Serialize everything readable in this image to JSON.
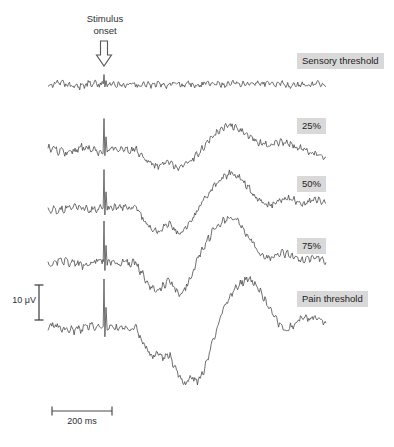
{
  "figure": {
    "type": "evoked-potential-traces",
    "background_color": "#ffffff",
    "trace_color": "#4a4a4a",
    "label_background_color": "#d9d9d9",
    "label_text_color": "#1d1d1d"
  },
  "annotations": {
    "stimulus_onset_label": "Stimulus\nonset",
    "stimulus_onset_icon": "arrow-down-icon",
    "amplitude_scale_label": "10 μV",
    "time_scale_label": "200 ms"
  },
  "chart_data": {
    "type": "line",
    "title": "",
    "xlabel": "",
    "ylabel": "",
    "legend_position": "right-inline",
    "grid": false,
    "scale_bars": {
      "amplitude": {
        "label": "10 μV",
        "value": 10,
        "unit": "μV"
      },
      "time": {
        "label": "200 ms",
        "value": 200,
        "unit": "ms"
      }
    },
    "stimulus_onset_ms": 0,
    "x_range_ms": [
      -250,
      1200
    ],
    "series": [
      {
        "name": "Sensory threshold",
        "label": "Sensory threshold",
        "baseline_y": 85,
        "n2_amplitude_uv": 0.5,
        "p2_amplitude_uv": 0.8,
        "noise_amplitude_uv": 1.0,
        "artifact_amplitude_uv": 3.0,
        "values": [
          0,
          0.3,
          -0.2,
          0.4,
          -0.3,
          0.2,
          0.5,
          -0.4,
          0.1,
          0.3,
          -0.2,
          0.4,
          0,
          -0.3,
          0.2,
          0.5,
          0.3,
          -0.1,
          0.4,
          0.2,
          -0.3,
          0.1,
          0.5,
          0.3,
          0,
          0.4,
          -0.2,
          0.3,
          0.6,
          0.4,
          0.2,
          0.5,
          0.3,
          0.7,
          0.5,
          0.3,
          0.6,
          0.4,
          0.2,
          0.5,
          0.1,
          -0.2,
          0.3,
          0,
          0.2,
          -0.3,
          0.1,
          0.4,
          0.2,
          -0.1
        ]
      },
      {
        "name": "25%",
        "label": "25%",
        "baseline_y": 150,
        "n2_amplitude_uv": -5.0,
        "p2_amplitude_uv": 7.0,
        "noise_amplitude_uv": 1.2,
        "artifact_amplitude_uv": 9.0,
        "values": [
          0,
          0.3,
          -0.2,
          0.4,
          -0.3,
          0.2,
          -1.5,
          -3.0,
          -4.2,
          -4.8,
          -4.0,
          -3.2,
          -4.5,
          -5.0,
          -4.2,
          -3.0,
          -1.5,
          0.5,
          2.5,
          4.2,
          5.6,
          6.6,
          7.0,
          6.4,
          5.4,
          4.2,
          3.0,
          2.2,
          1.6,
          1.2,
          1.8,
          2.4,
          2.0,
          1.4,
          0.8,
          0.2,
          -0.4,
          -1.0,
          -1.4,
          -1.8
        ]
      },
      {
        "name": "50%",
        "label": "50%",
        "baseline_y": 208,
        "n2_amplitude_uv": -7.5,
        "p2_amplitude_uv": 10.0,
        "noise_amplitude_uv": 1.2,
        "artifact_amplitude_uv": 11.0,
        "values": [
          0,
          0.3,
          -0.2,
          0.4,
          -0.3,
          0.2,
          -2.0,
          -4.5,
          -6.0,
          -6.8,
          -5.5,
          -4.5,
          -6.2,
          -7.5,
          -6.0,
          -3.5,
          -1.0,
          1.8,
          4.0,
          6.0,
          7.8,
          9.2,
          10.0,
          9.4,
          8.0,
          6.2,
          4.2,
          2.6,
          1.4,
          0.8,
          1.4,
          2.2,
          2.8,
          2.4,
          1.8,
          1.2,
          1.8,
          2.6,
          2.2,
          1.0
        ]
      },
      {
        "name": "75%",
        "label": "75%",
        "baseline_y": 263,
        "n2_amplitude_uv": -9.0,
        "p2_amplitude_uv": 13.0,
        "noise_amplitude_uv": 1.3,
        "artifact_amplitude_uv": 12.0,
        "values": [
          0,
          0.5,
          -0.3,
          0.6,
          -0.4,
          0.3,
          -2.5,
          -5.0,
          -7.0,
          -8.0,
          -6.5,
          -5.2,
          -7.2,
          -9.0,
          -7.0,
          -3.5,
          0.5,
          4.0,
          7.0,
          9.5,
          11.2,
          12.4,
          13.0,
          12.2,
          10.4,
          8.0,
          5.6,
          3.4,
          2.0,
          1.4,
          2.2,
          3.0,
          2.6,
          1.8,
          1.2,
          0.6,
          1.2,
          1.8,
          1.4,
          0.6
        ]
      },
      {
        "name": "Pain threshold",
        "label": "Pain threshold",
        "baseline_y": 328,
        "n2_amplitude_uv": -16.0,
        "p2_amplitude_uv": 14.0,
        "noise_amplitude_uv": 1.3,
        "artifact_amplitude_uv": 14.0,
        "values": [
          0,
          0.4,
          -0.3,
          0.5,
          -0.4,
          0.2,
          -3.0,
          -6.0,
          -8.0,
          -7.0,
          -8.5,
          -7.5,
          -11.0,
          -14.5,
          -16.0,
          -14.0,
          -15.5,
          -13.0,
          -8.0,
          -3.0,
          2.0,
          6.5,
          9.5,
          11.5,
          13.0,
          14.0,
          13.2,
          11.0,
          8.0,
          5.0,
          2.5,
          0.5,
          -0.5,
          0.5,
          2.0,
          3.0,
          2.6,
          3.2,
          2.4,
          1.0
        ]
      }
    ]
  }
}
